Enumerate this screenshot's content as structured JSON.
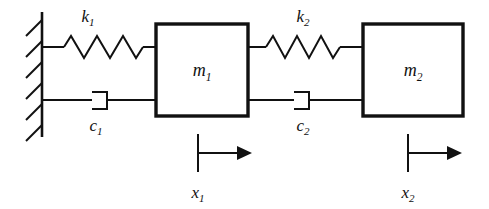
{
  "diagram": {
    "stroke_color": "#111111",
    "background_color": "#ffffff",
    "masses": [
      {
        "id": "m1",
        "base": "m",
        "sub": "1",
        "label": "m₁"
      },
      {
        "id": "m2",
        "base": "m",
        "sub": "2",
        "label": "m₂"
      }
    ],
    "springs": [
      {
        "id": "k1",
        "base": "k",
        "sub": "1",
        "label": "k₁",
        "coils": 5
      },
      {
        "id": "k2",
        "base": "k",
        "sub": "2",
        "label": "k₂",
        "coils": 5
      }
    ],
    "dampers": [
      {
        "id": "c1",
        "base": "c",
        "sub": "1",
        "label": "c₁"
      },
      {
        "id": "c2",
        "base": "c",
        "sub": "2",
        "label": "c₂"
      }
    ],
    "displacements": [
      {
        "id": "x1",
        "base": "x",
        "sub": "1",
        "label": "x₁",
        "direction": "right"
      },
      {
        "id": "x2",
        "base": "x",
        "sub": "2",
        "label": "x₂",
        "direction": "right"
      }
    ],
    "wall": {
      "name": "fixed-support-wall",
      "hatch_count": 6,
      "hatch_direction": "down-left"
    }
  }
}
